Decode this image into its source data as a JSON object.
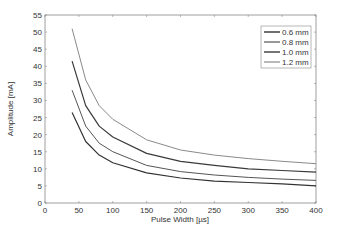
{
  "chart_data": {
    "type": "line",
    "title": "",
    "xlabel": "Pulse Width [µs]",
    "ylabel": "Amplitude [mA]",
    "xlim": [
      0,
      400
    ],
    "ylim": [
      0,
      55
    ],
    "xticks": [
      0,
      50,
      100,
      150,
      200,
      250,
      300,
      350,
      400
    ],
    "yticks": [
      0,
      5,
      10,
      15,
      20,
      25,
      30,
      35,
      40,
      45,
      50,
      55
    ],
    "grid": false,
    "legend_position": "upper right",
    "x": [
      40,
      60,
      80,
      100,
      150,
      200,
      250,
      300,
      350,
      400
    ],
    "series": [
      {
        "name": "0.6 mm",
        "color": "#333333",
        "width": 1.2,
        "values": [
          26.5,
          18.0,
          14.0,
          11.8,
          8.8,
          7.3,
          6.4,
          6.0,
          5.6,
          5.0
        ]
      },
      {
        "name": "0.8 mm",
        "color": "#555555",
        "width": 1.0,
        "values": [
          33.0,
          22.5,
          17.5,
          15.0,
          11.0,
          9.2,
          8.2,
          7.5,
          7.0,
          6.6
        ]
      },
      {
        "name": "1.0 mm",
        "color": "#3a3a3a",
        "width": 1.2,
        "values": [
          41.5,
          28.5,
          22.5,
          19.3,
          14.5,
          12.2,
          11.0,
          10.0,
          9.5,
          9.0
        ]
      },
      {
        "name": "1.2 mm",
        "color": "#8a8a8a",
        "width": 1.0,
        "values": [
          51.0,
          36.0,
          28.5,
          24.5,
          18.5,
          15.5,
          14.0,
          13.0,
          12.2,
          11.5
        ]
      }
    ]
  }
}
